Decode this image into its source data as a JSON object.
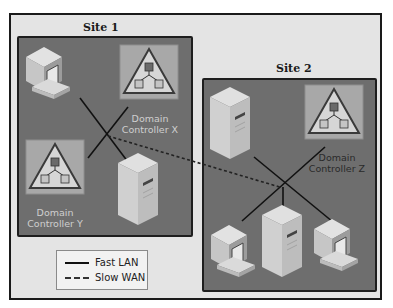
{
  "diagram": {
    "sites": [
      {
        "label": "Site 1"
      },
      {
        "label": "Site 2"
      }
    ],
    "domain_controllers": [
      {
        "line1": "Domain",
        "line2": "Controller X",
        "site": "Site 1"
      },
      {
        "line1": "Domain",
        "line2": "Controller Y",
        "site": "Site 1"
      },
      {
        "line1": "Domain",
        "line2": "Controller Z",
        "site": "Site 2"
      }
    ],
    "legend": {
      "items": [
        {
          "label": "Fast LAN",
          "style": "solid"
        },
        {
          "label": "Slow WAN",
          "style": "dashed"
        }
      ]
    },
    "colors": {
      "frame_bg": "#e4e4e4",
      "site_bg": "#6e6e6e",
      "dc_tile": "#a8a8a8",
      "device_light": "#d8d8d8",
      "line": "#111111"
    }
  }
}
